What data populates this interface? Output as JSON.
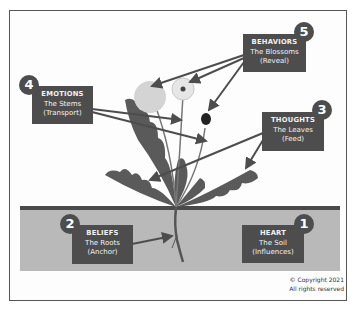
{
  "diagram": {
    "labels": [
      {
        "number": "1",
        "title": "HEART",
        "subtitle": "The Soil",
        "role": "(Influences)"
      },
      {
        "number": "2",
        "title": "BELIEFS",
        "subtitle": "The Roots",
        "role": "(Anchor)"
      },
      {
        "number": "3",
        "title": "THOUGHTS",
        "subtitle": "The Leaves",
        "role": "(Feed)"
      },
      {
        "number": "4",
        "title": "EMOTIONS",
        "subtitle": "The Stems",
        "role": "(Transport)"
      },
      {
        "number": "5",
        "title": "BEHAVIORS",
        "subtitle": "The Blossoms",
        "role": "(Reveal)"
      }
    ],
    "copyright": {
      "line1": "© Copyright 2021",
      "line2": "All rights reserved"
    }
  },
  "colors": {
    "label_bg": "#4d4d4d",
    "label_text": "#f2f2f2",
    "soil": "#b9b9b9",
    "soil_line": "#4a4a4a",
    "plant": "#555555",
    "arrow": "#4d4d4d"
  }
}
